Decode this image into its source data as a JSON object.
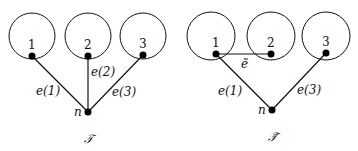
{
  "left_tree": {
    "caption": "𝒯",
    "root_label": "n",
    "leaves": [
      {
        "label": "1",
        "edge": "e(1)"
      },
      {
        "label": "2",
        "edge": "e(2)"
      },
      {
        "label": "3",
        "edge": "e(3)"
      }
    ]
  },
  "right_tree": {
    "caption": "𝒯̃",
    "root_label": "n",
    "leaves": [
      {
        "label": "1",
        "edge": "e(1)"
      },
      {
        "label": "2",
        "edge": ""
      },
      {
        "label": "3",
        "edge": "e(3)"
      }
    ],
    "extra_edge": "ẽ"
  },
  "colors": {
    "stroke": "#111111",
    "background": "#ffffff"
  }
}
